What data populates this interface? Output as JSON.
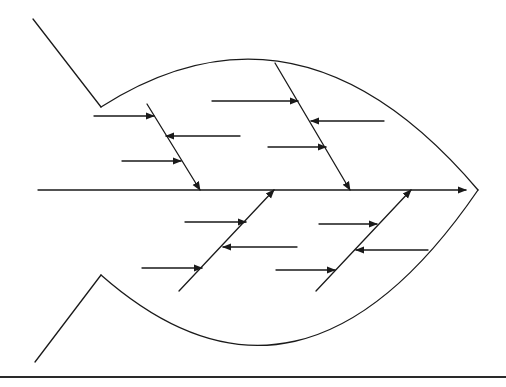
{
  "diagram": {
    "type": "fishbone",
    "title": "",
    "colors": {
      "line": "#1a1a1a",
      "background": "#ffffff",
      "rule": "#2a2a2a"
    },
    "outline": {
      "tail_top": [
        [
          33,
          19
        ],
        [
          101,
          107
        ]
      ],
      "tail_bottom": [
        [
          101,
          275
        ],
        [
          35,
          362
        ]
      ],
      "body_top": "M101 107 Q 300 -20 478 190",
      "body_bottom": "M101 275 Q 300 450 478 190"
    },
    "spine": {
      "from": [
        38,
        190
      ],
      "to": [
        466,
        190
      ]
    },
    "bones": [
      {
        "id": "upper-left",
        "from": [
          147,
          104
        ],
        "to": [
          200,
          190
        ],
        "ribs": [
          {
            "from": [
              94,
              116
            ],
            "to": [
              154,
              116
            ],
            "dir": "in"
          },
          {
            "from": [
              240,
              136
            ],
            "to": [
              166,
              136
            ],
            "dir": "out"
          },
          {
            "from": [
              122,
              161
            ],
            "to": [
              181,
              161
            ],
            "dir": "in"
          }
        ]
      },
      {
        "id": "upper-right",
        "from": [
          275,
          63
        ],
        "to": [
          350,
          190
        ],
        "ribs": [
          {
            "from": [
              212,
              101
            ],
            "to": [
              298,
              101
            ],
            "dir": "in"
          },
          {
            "from": [
              384,
              121
            ],
            "to": [
              311,
              121
            ],
            "dir": "out"
          },
          {
            "from": [
              268,
              147
            ],
            "to": [
              326,
              147
            ],
            "dir": "in"
          }
        ]
      },
      {
        "id": "lower-left",
        "from": [
          179,
          291
        ],
        "to": [
          274,
          190
        ],
        "ribs": [
          {
            "from": [
              185,
              222
            ],
            "to": [
              246,
              222
            ],
            "dir": "in"
          },
          {
            "from": [
              297,
              247
            ],
            "to": [
              223,
              247
            ],
            "dir": "out"
          },
          {
            "from": [
              142,
              268
            ],
            "to": [
              202,
              268
            ],
            "dir": "in"
          }
        ]
      },
      {
        "id": "lower-right",
        "from": [
          316,
          291
        ],
        "to": [
          411,
          190
        ],
        "ribs": [
          {
            "from": [
              319,
              224
            ],
            "to": [
              377,
              224
            ],
            "dir": "in"
          },
          {
            "from": [
              428,
              250
            ],
            "to": [
              356,
              250
            ],
            "dir": "out"
          },
          {
            "from": [
              276,
              270
            ],
            "to": [
              335,
              270
            ],
            "dir": "in"
          }
        ]
      }
    ],
    "bottom_rule": {
      "y": 377,
      "x1": 0,
      "x2": 506
    }
  }
}
